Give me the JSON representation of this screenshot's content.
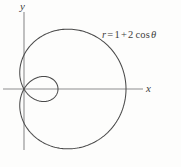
{
  "figure": {
    "background_color": "#fdfdfc",
    "curve_color": "#4a4a4a",
    "axis_color": "#8d8d8d",
    "axis_labels": {
      "x": "x",
      "y": "y"
    },
    "equation": {
      "lhs": "r",
      "equals": "=",
      "term_constant": "1",
      "plus": "+",
      "term_coefficient": "2",
      "function": "cos",
      "angle": "θ",
      "full_text": "r = 1 + 2 cos θ"
    }
  },
  "chart_data": {
    "type": "line",
    "title": "",
    "subtitle": "",
    "xlabel": "x",
    "ylabel": "y",
    "coordinate_system": "polar",
    "grid": false,
    "legend": "none",
    "annotations": [
      {
        "text": "r = 1 + 2 cos θ",
        "x": 2.35,
        "y": 1.6
      }
    ],
    "series": [
      {
        "name": "r = 1 + 2 cos θ",
        "equation": "r = 1 + 2*cos(theta)",
        "curve_family": "limacon with inner loop",
        "parameters": {
          "a": 1,
          "b": 2
        },
        "theta_range_deg": [
          0,
          360
        ],
        "r_max": 3,
        "r_min": -1,
        "inner_loop_theta_deg": [
          120,
          240
        ],
        "x_intercepts": [
          3,
          -1
        ],
        "y_extent": [
          -1.65,
          1.65
        ],
        "x_extent": [
          -1,
          3
        ],
        "points_polar_deg": [
          {
            "theta": 0,
            "r": 3
          },
          {
            "theta": 30,
            "r": 2.732
          },
          {
            "theta": 60,
            "r": 2
          },
          {
            "theta": 90,
            "r": 1
          },
          {
            "theta": 120,
            "r": 0
          },
          {
            "theta": 150,
            "r": -0.732
          },
          {
            "theta": 180,
            "r": -1
          },
          {
            "theta": 210,
            "r": -0.732
          },
          {
            "theta": 240,
            "r": 0
          },
          {
            "theta": 270,
            "r": 1
          },
          {
            "theta": 300,
            "r": 2
          },
          {
            "theta": 330,
            "r": 2.732
          },
          {
            "theta": 360,
            "r": 3
          }
        ]
      }
    ],
    "axis_ranges": {
      "x_axis_pixels": [
        3,
        143
      ],
      "y_axis_pixels": [
        12,
        150
      ],
      "origin_pixels": [
        24,
        89
      ],
      "scale_px_per_unit": 34
    }
  }
}
